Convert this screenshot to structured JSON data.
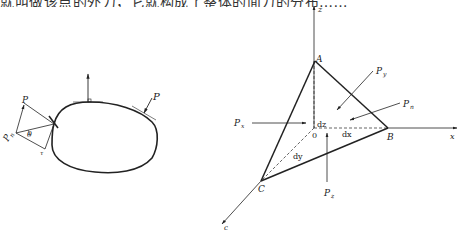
{
  "top_text": "就叫做该点的外力，它就构成了整体的面力的分布……",
  "left_figure": {
    "labels": {
      "p": "P",
      "p_right": "P",
      "pn_main": "P",
      "pn_sub": "n",
      "theta": "θ",
      "tau": "τ"
    }
  },
  "right_figure": {
    "axes": {
      "x": "x",
      "y": "c",
      "z": "z"
    },
    "vertices": {
      "a": "A",
      "b": "B",
      "c": "C",
      "o": "0"
    },
    "edges": {
      "dx": "dx",
      "dy": "dy",
      "dz": "dz"
    },
    "forces": {
      "px": {
        "main": "P",
        "sub": "x"
      },
      "py": {
        "main": "P",
        "sub": "y"
      },
      "pz": {
        "main": "P",
        "sub": "z"
      },
      "pn": {
        "main": "P",
        "sub": "n"
      }
    }
  },
  "colors": {
    "line": "#222222",
    "background": "#ffffff"
  }
}
